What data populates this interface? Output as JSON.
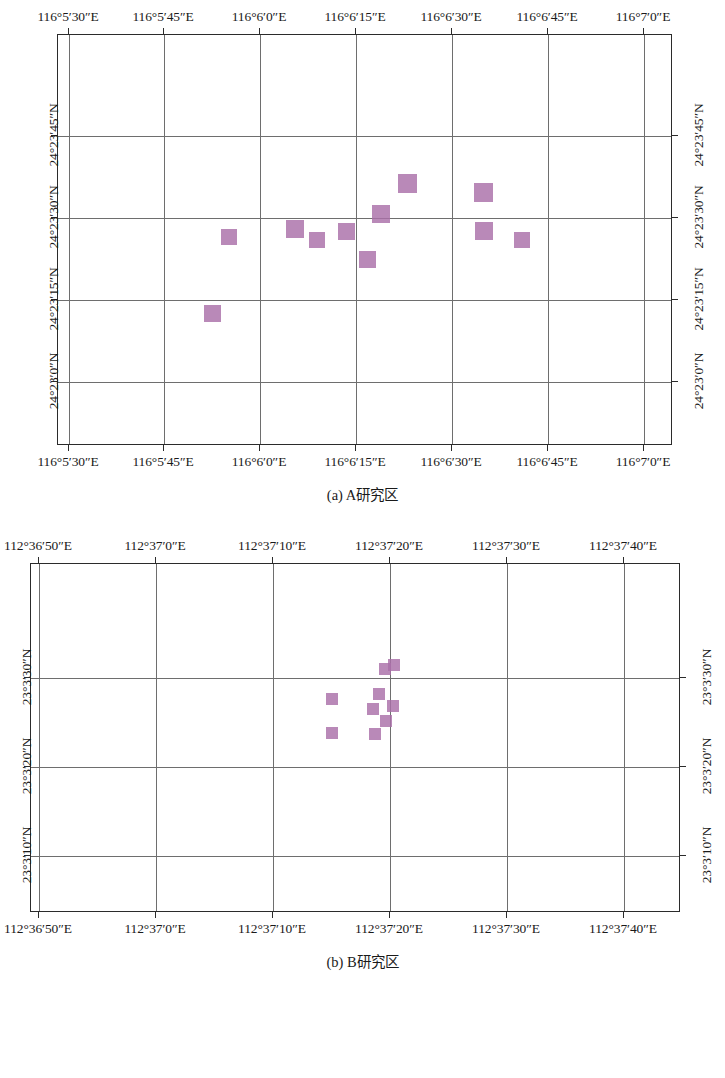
{
  "figure": {
    "panels": [
      {
        "id": "a",
        "caption": "(a) A研究区",
        "caption_prefix": "(a) ",
        "caption_body": "A研究区",
        "x_ticks": [
          "116°5′30″E",
          "116°5′45″E",
          "116°6′0″E",
          "116°6′15″E",
          "116°6′30″E",
          "116°6′45″E",
          "116°7′0″E"
        ],
        "y_ticks": [
          "24°23′0″N",
          "24°23′15″N",
          "24°23′30″N",
          "24°23′45″N"
        ],
        "chart_data": {
          "type": "scatter",
          "title": "(a) A研究区",
          "xlabel": "",
          "ylabel": "",
          "grid": true,
          "legend": "none",
          "marker_color": "#a96fa8",
          "marker_shape": "square",
          "xlim": [
            "116°5′22″E",
            "116°7′5″E"
          ],
          "ylim": [
            "24°22′52″N",
            "24°23′52″N"
          ],
          "x_tick_labels": [
            "116°5′30″E",
            "116°5′45″E",
            "116°6′0″E",
            "116°6′15″E",
            "116°6′30″E",
            "116°6′45″E",
            "116°7′0″E"
          ],
          "y_tick_labels": [
            "24°23′0″N",
            "24°23′15″N",
            "24°23′30″N",
            "24°23′45″N"
          ],
          "points": [
            {
              "x": "116°5′47″E",
              "y": "24°23′5″N"
            },
            {
              "x": "116°5′53″E",
              "y": "24°23′23″N"
            },
            {
              "x": "116°6′0″E",
              "y": "24°23′27″N"
            },
            {
              "x": "116°6′3″E",
              "y": "24°23′24″N"
            },
            {
              "x": "116°6′6″E",
              "y": "24°23′26″N"
            },
            {
              "x": "116°6′9″E",
              "y": "24°23′21″N"
            },
            {
              "x": "116°6′12″E",
              "y": "24°23′30″N"
            },
            {
              "x": "116°6′16″E",
              "y": "24°23′38″N"
            },
            {
              "x": "116°6′27″E",
              "y": "24°23′36″N"
            },
            {
              "x": "116°6′27″E",
              "y": "24°23′32″N"
            },
            {
              "x": "116°6′41″E",
              "y": "24°23′24″N"
            }
          ]
        }
      },
      {
        "id": "b",
        "caption": "(b) B研究区",
        "caption_prefix": "(b) ",
        "caption_body": "B研究区",
        "x_ticks": [
          "112°36′50″E",
          "112°37′0″E",
          "112°37′10″E",
          "112°37′20″E",
          "112°37′30″E",
          "112°37′40″E"
        ],
        "y_ticks": [
          "23°3′10″N",
          "23°3′20″N",
          "23°3′30″N"
        ],
        "chart_data": {
          "type": "scatter",
          "title": "(b) B研究区",
          "xlabel": "",
          "ylabel": "",
          "grid": true,
          "legend": "none",
          "marker_color": "#a96fa8",
          "marker_shape": "square",
          "xlim": [
            "112°36′44″E",
            "112°37′46″E"
          ],
          "ylim": [
            "23°3′2″N",
            "23°3′40″N"
          ],
          "x_tick_labels": [
            "112°36′50″E",
            "112°37′0″E",
            "112°37′10″E",
            "112°37′20″E",
            "112°37′30″E",
            "112°37′40″E"
          ],
          "y_tick_labels": [
            "23°3′10″N",
            "23°3′20″N",
            "23°3′30″N"
          ],
          "points": [
            {
              "x": "112°37′12″E",
              "y": "23°3′27″N"
            },
            {
              "x": "112°37′12″E",
              "y": "23°3′23″N"
            },
            {
              "x": "112°37′18″E",
              "y": "23°3′29″N"
            },
            {
              "x": "112°37′19″E",
              "y": "23°3′30″N"
            },
            {
              "x": "112°37′17″E",
              "y": "23°3′26″N"
            },
            {
              "x": "112°37′16″E",
              "y": "23°3′25″N"
            },
            {
              "x": "112°37′19″E",
              "y": "23°3′25″N"
            },
            {
              "x": "112°37′18″E",
              "y": "23°3′23″N"
            },
            {
              "x": "112°37′16″E",
              "y": "23°3′22″N"
            }
          ]
        }
      }
    ]
  },
  "geometry": {
    "panel_a": {
      "frame": {
        "left": 57,
        "top": 34,
        "width": 615,
        "height": 411
      },
      "x_tick_px": [
        68,
        163,
        259,
        355,
        451,
        547,
        643
      ],
      "y_tick_px": [
        381,
        299,
        217,
        135
      ],
      "markers": [
        {
          "x": 211,
          "y": 312,
          "s": 17
        },
        {
          "x": 228,
          "y": 236,
          "s": 16
        },
        {
          "x": 294,
          "y": 228,
          "s": 18
        },
        {
          "x": 316,
          "y": 239,
          "s": 16
        },
        {
          "x": 345,
          "y": 230,
          "s": 17
        },
        {
          "x": 366,
          "y": 258,
          "s": 17
        },
        {
          "x": 380,
          "y": 213,
          "s": 18
        },
        {
          "x": 406,
          "y": 182,
          "s": 19
        },
        {
          "x": 482,
          "y": 191,
          "s": 19
        },
        {
          "x": 483,
          "y": 230,
          "s": 18
        },
        {
          "x": 521,
          "y": 239,
          "s": 16
        }
      ]
    },
    "panel_b": {
      "frame": {
        "left": 30,
        "top": 43,
        "width": 650,
        "height": 349
      },
      "x_tick_px": [
        38,
        155,
        272,
        389,
        506,
        623
      ],
      "y_tick_px": [
        335,
        246,
        157
      ],
      "markers": [
        {
          "x": 331,
          "y": 178,
          "s": 12
        },
        {
          "x": 331,
          "y": 212,
          "s": 12
        },
        {
          "x": 384,
          "y": 148,
          "s": 12
        },
        {
          "x": 393,
          "y": 144,
          "s": 12
        },
        {
          "x": 378,
          "y": 173,
          "s": 12
        },
        {
          "x": 372,
          "y": 188,
          "s": 12
        },
        {
          "x": 392,
          "y": 185,
          "s": 12
        },
        {
          "x": 385,
          "y": 200,
          "s": 12
        },
        {
          "x": 374,
          "y": 213,
          "s": 12
        }
      ]
    }
  }
}
